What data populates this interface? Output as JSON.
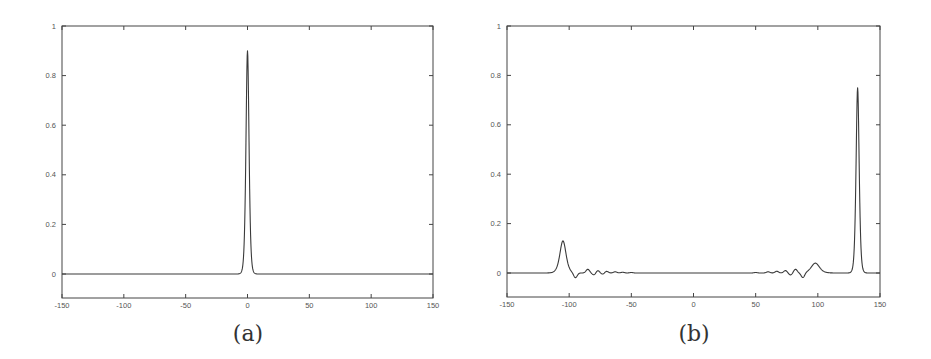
{
  "figure": {
    "panels": [
      {
        "id": "a",
        "label": "(a)"
      },
      {
        "id": "b",
        "label": "(b)"
      }
    ]
  },
  "chart_data": [
    {
      "type": "line",
      "panel": "(a)",
      "title": "",
      "xlabel": "",
      "ylabel": "",
      "xlim": [
        -150,
        150
      ],
      "ylim": [
        -0.1,
        1
      ],
      "grid": false,
      "legend": null,
      "x_ticks": [
        -150,
        -100,
        -50,
        0,
        50,
        100,
        150
      ],
      "y_ticks": [
        0,
        0.2,
        0.4,
        0.6,
        0.8,
        1
      ],
      "x_tick_labels": [
        "-150",
        "-100",
        "-50",
        "0",
        "50",
        "100",
        "150"
      ],
      "y_tick_labels": [
        "0",
        "0.2",
        "0.4",
        "0.6",
        "0.8",
        "1"
      ],
      "series": [
        {
          "name": "profile",
          "description": "single narrow sech-like pulse centered at x=0",
          "peaks": [
            {
              "x": 0,
              "y": 0.9,
              "width": 3
            }
          ],
          "x": [
            -150,
            -50,
            -10,
            -6,
            -4,
            -3,
            -2,
            -1,
            0,
            1,
            2,
            3,
            4,
            6,
            10,
            50,
            150
          ],
          "y": [
            0,
            0,
            0.003,
            0.03,
            0.1,
            0.2,
            0.4,
            0.7,
            0.9,
            0.7,
            0.4,
            0.2,
            0.1,
            0.03,
            0.003,
            0,
            0
          ]
        }
      ]
    },
    {
      "type": "line",
      "panel": "(b)",
      "title": "",
      "xlabel": "",
      "ylabel": "",
      "xlim": [
        -150,
        150
      ],
      "ylim": [
        -0.1,
        1
      ],
      "grid": false,
      "legend": null,
      "x_ticks": [
        -150,
        -100,
        -50,
        0,
        50,
        100,
        150
      ],
      "y_ticks": [
        0,
        0.2,
        0.4,
        0.6,
        0.8,
        1
      ],
      "x_tick_labels": [
        "-150",
        "-100",
        "-50",
        "0",
        "50",
        "100",
        "150"
      ],
      "y_tick_labels": [
        "0",
        "0.2",
        "0.4",
        "0.6",
        "0.8",
        "1"
      ],
      "series": [
        {
          "name": "profile",
          "description": "tall pulse near x=132, smaller pulse near x=-105, small bump near x=98, decaying oscillatory ripples between them",
          "peaks": [
            {
              "x": -105,
              "y": 0.13,
              "width": 6
            },
            {
              "x": 98,
              "y": 0.04,
              "width": 8
            },
            {
              "x": 132,
              "y": 0.75,
              "width": 3
            }
          ],
          "ripples": [
            {
              "x": -95,
              "y": -0.02
            },
            {
              "x": -85,
              "y": 0.015
            },
            {
              "x": -80,
              "y": -0.008
            },
            {
              "x": -77,
              "y": 0.01
            },
            {
              "x": -73,
              "y": -0.005
            },
            {
              "x": -70,
              "y": 0.007
            },
            {
              "x": -63,
              "y": 0.005
            },
            {
              "x": -57,
              "y": 0.003
            },
            {
              "x": -50,
              "y": 0.002
            },
            {
              "x": 50,
              "y": 0.002
            },
            {
              "x": 60,
              "y": 0.005
            },
            {
              "x": 67,
              "y": 0.007
            },
            {
              "x": 74,
              "y": 0.01
            },
            {
              "x": 78,
              "y": -0.008
            },
            {
              "x": 82,
              "y": 0.015
            },
            {
              "x": 88,
              "y": -0.02
            }
          ]
        }
      ]
    }
  ]
}
